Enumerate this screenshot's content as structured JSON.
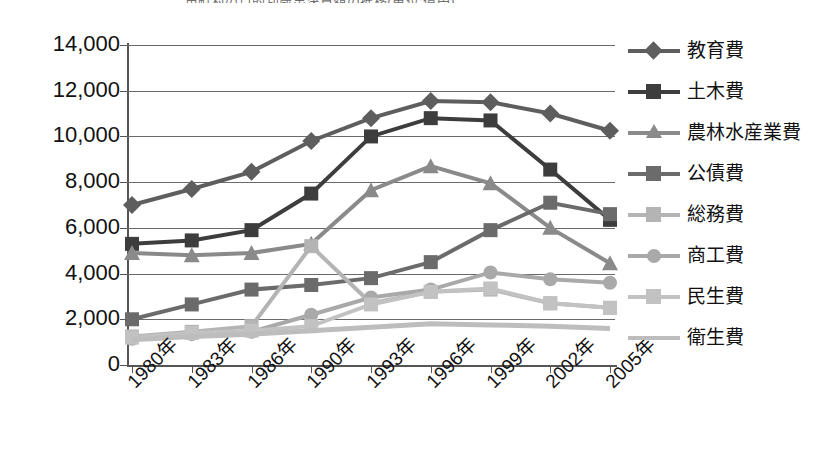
{
  "title": "市町村の目的別歳出決算額の推移(単位:億円)",
  "chart_data": {
    "type": "line",
    "title": "市町村の目的別歳出決算額の推移(単位:億円)",
    "xlabel": "",
    "ylabel": "",
    "categories": [
      "1980年",
      "1983年",
      "1986年",
      "1990年",
      "1993年",
      "1996年",
      "1999年",
      "2002年",
      "2005年"
    ],
    "ylim": [
      0,
      14000
    ],
    "ytick_step": 2000,
    "ytick_labels": [
      "14,000",
      "12,000",
      "10,000",
      "8,000",
      "6,000",
      "4,000",
      "2,000",
      "0"
    ],
    "grid": true,
    "legend_position": "right",
    "series": [
      {
        "name": "教育費",
        "marker": "diamond",
        "color": "#5e5e5e",
        "values": [
          7000,
          7700,
          8450,
          9800,
          10800,
          11550,
          11500,
          11000,
          10250
        ]
      },
      {
        "name": "土木費",
        "marker": "square",
        "color": "#3d3d3d",
        "values": [
          5300,
          5450,
          5900,
          7500,
          10000,
          10800,
          10700,
          8550,
          6350
        ]
      },
      {
        "name": "農林水産業費",
        "marker": "triangle",
        "color": "#8a8a8a",
        "values": [
          4900,
          4800,
          4900,
          5300,
          7650,
          8700,
          7950,
          6000,
          4450
        ]
      },
      {
        "name": "公債費",
        "marker": "square",
        "color": "#6b6b6b",
        "values": [
          2000,
          2650,
          3300,
          3500,
          3800,
          4500,
          5900,
          7100,
          6600
        ]
      },
      {
        "name": "総務費",
        "marker": "square",
        "color": "#b4b4b4",
        "values": [
          1250,
          1450,
          1700,
          5200,
          2700,
          3200,
          3300,
          2700,
          2500
        ]
      },
      {
        "name": "商工費",
        "marker": "circle",
        "color": "#a9a9a9",
        "values": [
          1150,
          1350,
          1450,
          2200,
          2950,
          3300,
          4050,
          3750,
          3600
        ]
      },
      {
        "name": "民生費",
        "marker": "square",
        "color": "#c2c2c2",
        "values": [
          1200,
          1400,
          1500,
          1700,
          2650,
          3200,
          3350,
          2700,
          2500
        ]
      },
      {
        "name": "衛生費",
        "marker": "none",
        "color": "#bdbdbd",
        "values": [
          1100,
          1250,
          1350,
          1500,
          1650,
          1800,
          1750,
          1700,
          1600
        ]
      }
    ]
  },
  "legend": {
    "items": [
      {
        "label": "教育費",
        "marker": "diamond",
        "color": "#5e5e5e"
      },
      {
        "label": "土木費",
        "marker": "square",
        "color": "#3d3d3d"
      },
      {
        "label": "農林水産業費",
        "marker": "triangle",
        "color": "#8a8a8a"
      },
      {
        "label": "公債費",
        "marker": "square",
        "color": "#6b6b6b"
      },
      {
        "label": "総務費",
        "marker": "square",
        "color": "#b4b4b4"
      },
      {
        "label": "商工費",
        "marker": "circle",
        "color": "#a9a9a9"
      },
      {
        "label": "民生費",
        "marker": "square",
        "color": "#c2c2c2"
      },
      {
        "label": "衛生費",
        "marker": "none",
        "color": "#bdbdbd"
      }
    ]
  }
}
